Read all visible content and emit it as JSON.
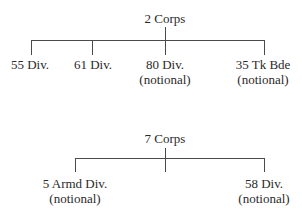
{
  "charts": [
    {
      "root": {
        "label": "2 Corps"
      },
      "children": [
        {
          "label": "55 Div.",
          "note": ""
        },
        {
          "label": "61 Div.",
          "note": ""
        },
        {
          "label": "80 Div.",
          "note": "(notional)"
        },
        {
          "label": "35 Tk Bde",
          "note": "(notional)"
        }
      ]
    },
    {
      "root": {
        "label": "7 Corps"
      },
      "children": [
        {
          "label": "5 Armd Div.",
          "note": "(notional)"
        },
        {
          "label": "58 Div.",
          "note": "(notional)"
        }
      ]
    }
  ]
}
